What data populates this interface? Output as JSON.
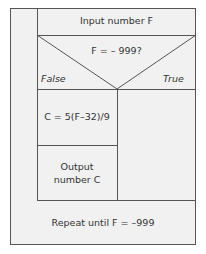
{
  "diagram": {
    "type": "nassi-shneiderman structured chart",
    "input_step": "Input number F",
    "decision": {
      "condition": "F = – 999?",
      "false_label": "False",
      "true_label": "True"
    },
    "false_branch": [
      "C = 5(F–32)/9",
      "Output",
      "number C"
    ],
    "true_branch": [],
    "loop_condition": "Repeat until F = –999"
  },
  "colors": {
    "background": "#f1f1f1",
    "lines": "#555555",
    "text": "#333333"
  }
}
